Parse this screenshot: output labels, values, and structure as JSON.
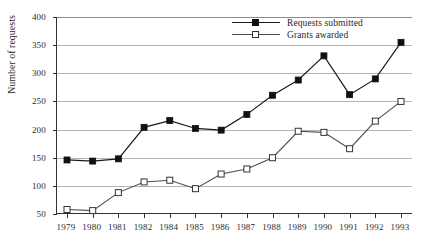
{
  "chart_data": {
    "type": "line",
    "title": "",
    "xlabel": "",
    "ylabel": "Number of requests",
    "ylim": [
      50,
      400
    ],
    "ytick_step": 50,
    "yticks": [
      50,
      100,
      150,
      200,
      250,
      300,
      350,
      400
    ],
    "grid": true,
    "legend_position": "top-right",
    "categories": [
      "1979",
      "1980",
      "1981",
      "1982",
      "1984",
      "1985",
      "1986",
      "1987",
      "1988",
      "1989",
      "1990",
      "1991",
      "1992",
      "1993"
    ],
    "x_tick_labels": [
      "1979",
      "1980",
      "1981",
      "1982",
      "1984",
      "1985",
      "1986",
      "1987",
      "1988",
      "1989",
      "1990",
      "1991",
      "1992",
      "1993"
    ],
    "series": [
      {
        "name": "Requests submitted",
        "marker": "filled-square",
        "color": "#111111",
        "values": [
          146,
          144,
          148,
          204,
          216,
          202,
          199,
          227,
          261,
          288,
          331,
          262,
          290,
          355
        ]
      },
      {
        "name": "Grants awarded",
        "marker": "open-square",
        "color": "#4d4d4d",
        "values": [
          58,
          56,
          88,
          107,
          110,
          95,
          121,
          130,
          150,
          197,
          195,
          166,
          215,
          250
        ]
      }
    ]
  },
  "axis": {
    "y_title": "Number of requests"
  },
  "legend": {
    "items": [
      {
        "label": "Requests submitted"
      },
      {
        "label": "Grants awarded"
      }
    ]
  },
  "colors": {
    "requests": "#111111",
    "grants": "#4d4d4d",
    "gridline": "#b4b4b4",
    "axis": "#333333",
    "background": "#ffffff"
  }
}
